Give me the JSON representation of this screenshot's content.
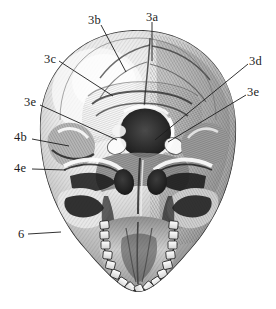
{
  "figure": {
    "style": "grayscale engraving / stipple-hatched anatomical illustration",
    "background_color": "#ffffff",
    "ink_color": "#1c1c1c",
    "width": 276,
    "height": 309
  },
  "labels": [
    {
      "id": "3a",
      "text": "3a",
      "text_x": 146,
      "text_y": 11,
      "leader": {
        "x1": 152,
        "y1": 22,
        "x2": 152,
        "y2": 61
      },
      "side": "top"
    },
    {
      "id": "3b",
      "text": "3b",
      "text_x": 88,
      "text_y": 14,
      "leader": {
        "x1": 101,
        "y1": 25,
        "x2": 126,
        "y2": 72
      },
      "side": "top-left"
    },
    {
      "id": "3c",
      "text": "3c",
      "text_x": 44,
      "text_y": 53,
      "leader": {
        "x1": 59,
        "y1": 61,
        "x2": 113,
        "y2": 96
      },
      "side": "left"
    },
    {
      "id": "3d",
      "text": "3d",
      "text_x": 249,
      "text_y": 55,
      "leader": {
        "x1": 248,
        "y1": 64,
        "x2": 155,
        "y2": 140
      },
      "side": "right"
    },
    {
      "id": "3e-right",
      "text": "3e",
      "text_x": 247,
      "text_y": 86,
      "leader": {
        "x1": 246,
        "y1": 95,
        "x2": 168,
        "y2": 142
      },
      "side": "right"
    },
    {
      "id": "3e-left",
      "text": "3e",
      "text_x": 24,
      "text_y": 96,
      "leader": {
        "x1": 40,
        "y1": 105,
        "x2": 117,
        "y2": 140
      },
      "side": "left"
    },
    {
      "id": "4b",
      "text": "4b",
      "text_x": 14,
      "text_y": 131,
      "leader": {
        "x1": 32,
        "y1": 139,
        "x2": 69,
        "y2": 146
      },
      "side": "left"
    },
    {
      "id": "4e",
      "text": "4e",
      "text_x": 14,
      "text_y": 162,
      "leader": {
        "x1": 32,
        "y1": 169,
        "x2": 66,
        "y2": 170
      },
      "side": "left"
    },
    {
      "id": "6",
      "text": "6",
      "text_x": 18,
      "text_y": 228,
      "leader": {
        "x1": 28,
        "y1": 234,
        "x2": 61,
        "y2": 232
      },
      "side": "left"
    }
  ]
}
